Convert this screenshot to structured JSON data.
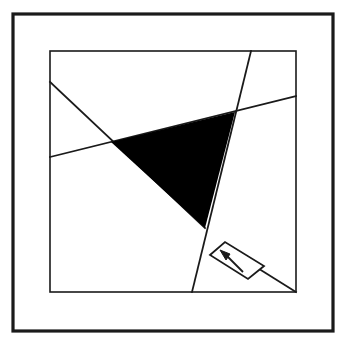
{
  "figure": {
    "canvas": {
      "width": 353,
      "height": 347
    },
    "colors": {
      "background": "#ffffff",
      "stroke": "#1a1a1a",
      "fill": "#000000"
    },
    "outer_frame": {
      "name": "outer-border",
      "x": 13,
      "y": 14,
      "width": 320,
      "height": 317,
      "stroke_width": 3.2,
      "fill": "none"
    },
    "inner_frame": {
      "name": "inner-square",
      "x": 50,
      "y": 51,
      "width": 246,
      "height": 241,
      "stroke_width": 1.6,
      "fill": "none"
    },
    "lines": [
      {
        "name": "line-descending-diagonal",
        "label": "A",
        "x1": 50,
        "y1": 82,
        "x2": 205,
        "y2": 228,
        "stroke_width": 1.8
      },
      {
        "name": "line-shallow-rising",
        "label": "B",
        "x1": 50,
        "y1": 157,
        "x2": 296,
        "y2": 96,
        "stroke_width": 1.8
      },
      {
        "name": "line-steep-falling",
        "label": "C",
        "x1": 251,
        "y1": 51,
        "x2": 192,
        "y2": 292,
        "stroke_width": 1.8
      },
      {
        "name": "line-arrow-tail",
        "label": "D",
        "x1": 248,
        "y1": 262,
        "x2": 296,
        "y2": 292,
        "stroke_width": 1.8
      }
    ],
    "shaded_triangle": {
      "name": "shaded-triangle",
      "points": "111,142 235,112 205,228",
      "vertices": [
        {
          "name": "vertex-left",
          "x": 111,
          "y": 142
        },
        {
          "name": "vertex-top-right",
          "x": 235,
          "y": 112
        },
        {
          "name": "vertex-bottom",
          "x": 205,
          "y": 228
        }
      ],
      "fill": "#000000"
    },
    "callout_box": {
      "name": "direction-callout-box",
      "points": "210,255 225,242 264,266 248,279",
      "stroke_width": 1.8,
      "fill": "none"
    },
    "callout_arrow": {
      "name": "direction-arrow",
      "shaft": {
        "x1": 243,
        "y1": 272,
        "x2": 226,
        "y2": 255
      },
      "head": "220,250 230,254 226,260",
      "stroke_width": 1.8,
      "direction": "up-left"
    }
  }
}
